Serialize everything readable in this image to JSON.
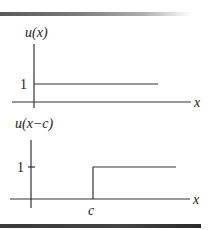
{
  "figure": {
    "top_plot": {
      "title": "u(x)",
      "y_tick_label": "1",
      "x_axis_label": "x",
      "description": "Unit step function: value 1 for x >= 0"
    },
    "bottom_plot": {
      "title": "u(x−c)",
      "y_tick_label": "1",
      "x_axis_label": "x",
      "x_tick_label": "c",
      "description": "Shifted unit step: value 1 for x >= c"
    },
    "colors": {
      "line": "#333333",
      "top_bar_start": "#5a5a5a",
      "bottom_bar": "#3a3a3a"
    }
  }
}
